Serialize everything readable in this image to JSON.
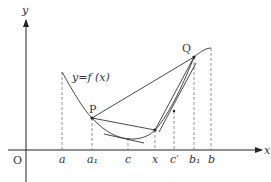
{
  "diagram": {
    "axes": {
      "x_label": "x",
      "y_label": "y",
      "origin_label": "O"
    },
    "curve_label": "y=f (x)",
    "points": {
      "P": "P",
      "Q": "Q"
    },
    "x_ticks": [
      {
        "label": "a",
        "x": 62
      },
      {
        "label": "a₁",
        "x": 92
      },
      {
        "label": "c",
        "x": 128
      },
      {
        "label": "x",
        "x": 155
      },
      {
        "label": "c′",
        "x": 174
      },
      {
        "label": "b₁",
        "x": 194
      },
      {
        "label": "b",
        "x": 211
      }
    ],
    "colors": {
      "line": "#333333",
      "dashed": "#777777"
    }
  }
}
